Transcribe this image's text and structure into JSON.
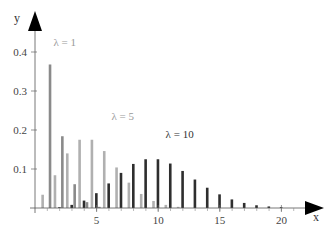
{
  "chart_data": {
    "type": "bar",
    "title": "",
    "xlabel": "x",
    "ylabel": "y",
    "xlim": [
      0,
      22
    ],
    "ylim": [
      0,
      0.45
    ],
    "grid": false,
    "legend": "inline labels",
    "x_ticks": [
      5,
      10,
      15,
      20
    ],
    "y_ticks": [
      0.1,
      0.2,
      0.3,
      0.4
    ],
    "x_tick_labels": [
      "5",
      "10",
      "15",
      "20"
    ],
    "y_tick_labels": [
      "0.1",
      "0.2",
      "0.3",
      "0.4"
    ],
    "series": [
      {
        "name": "λ = 1",
        "label": "λ = 1",
        "color": "#8a8a8a",
        "offset": 0.22,
        "label_pos": [
          1.5,
          0.415
        ],
        "x": [
          1,
          2,
          3,
          4,
          5
        ],
        "values": [
          0.368,
          0.184,
          0.061,
          0.015,
          0.003
        ]
      },
      {
        "name": "λ = 5",
        "label": "λ = 5",
        "color": "#b0b0b0",
        "offset": -0.38,
        "label_pos": [
          6.2,
          0.225
        ],
        "x": [
          1,
          2,
          3,
          4,
          5,
          6,
          7,
          8,
          9,
          10,
          11,
          12
        ],
        "values": [
          0.034,
          0.084,
          0.14,
          0.175,
          0.175,
          0.146,
          0.104,
          0.065,
          0.036,
          0.018,
          0.008,
          0.003
        ]
      },
      {
        "name": "λ = 10",
        "label": "λ = 10",
        "color": "#2e2e2e",
        "offset": -0.02,
        "label_pos": [
          10.6,
          0.18
        ],
        "x": [
          2,
          3,
          4,
          5,
          6,
          7,
          8,
          9,
          10,
          11,
          12,
          13,
          14,
          15,
          16,
          17,
          18,
          19,
          20
        ],
        "values": [
          0.002,
          0.008,
          0.019,
          0.038,
          0.063,
          0.09,
          0.113,
          0.125,
          0.125,
          0.114,
          0.095,
          0.073,
          0.052,
          0.035,
          0.022,
          0.013,
          0.007,
          0.004,
          0.002
        ]
      }
    ]
  }
}
